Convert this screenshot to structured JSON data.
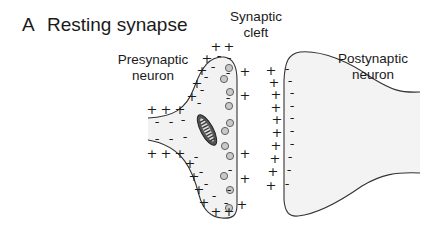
{
  "figure": {
    "panel_letter": "A",
    "title": "Resting synapse"
  },
  "labels": {
    "presynaptic_line1": "Presynaptic",
    "presynaptic_line2": "neuron",
    "cleft_line1": "Synaptic",
    "cleft_line2": "cleft",
    "postsynaptic_line1": "Postynaptic",
    "postsynaptic_line2": "neuron"
  },
  "symbols": {
    "positive": "+",
    "negative": "-"
  },
  "colors": {
    "outline": "#333333",
    "cell_fill": "#f2f2f2",
    "vesicle_fill": "#c8c8c8",
    "mitochondrion_fill": "#555555",
    "text": "#1a1a1a"
  },
  "charges": {
    "presynaptic_outside_positive_count": 21,
    "presynaptic_inside_negative_count": 19,
    "postsynaptic_outside_positive_count": 10,
    "postsynaptic_inside_negative_count": 10
  },
  "structures": {
    "synaptic_vesicle_count": 9,
    "mitochondrion_count": 1
  }
}
